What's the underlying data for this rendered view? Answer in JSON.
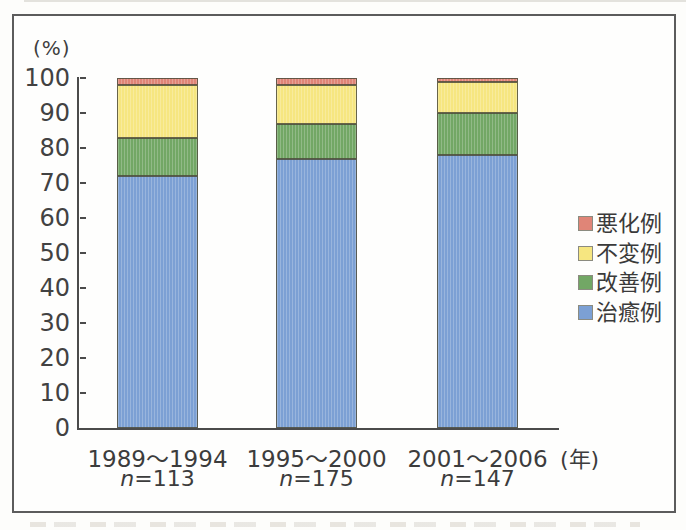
{
  "chart": {
    "y_axis_unit": "(%)",
    "x_axis_unit": "(年)",
    "y_ticks": [
      100,
      90,
      80,
      70,
      60,
      50,
      40,
      30,
      20,
      10,
      0
    ]
  },
  "chart_data": {
    "type": "bar",
    "stacked": true,
    "title": "",
    "categories": [
      "1989〜1994",
      "1995〜2000",
      "2001〜2006"
    ],
    "category_sublabels": [
      "n=113",
      "n=175",
      "n=147"
    ],
    "x_unit": "(年)",
    "ylabel": "(%)",
    "ylim": [
      0,
      100
    ],
    "grid": false,
    "legend_position": "right",
    "series_order": "top_to_bottom",
    "series": [
      {
        "name": "悪化例",
        "color": "#e08577",
        "values": [
          2,
          2,
          1
        ]
      },
      {
        "name": "不変例",
        "color": "#f6e680",
        "values": [
          15,
          11,
          9
        ]
      },
      {
        "name": "改善例",
        "color": "#72a765",
        "values": [
          11,
          10,
          12
        ]
      },
      {
        "name": "治癒例",
        "color": "#7ca0d4",
        "values": [
          72,
          77,
          78
        ]
      }
    ],
    "colors": {
      "axis": "#4b4b4b",
      "frame_border": "#5c5c5c",
      "text": "#3c3c3c"
    }
  }
}
